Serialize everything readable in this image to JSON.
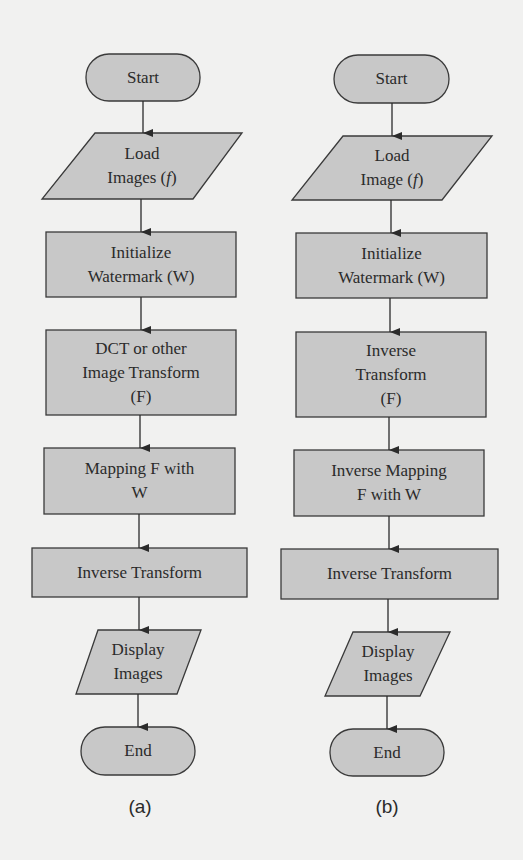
{
  "colors": {
    "background": "#f1f1f0",
    "shape_fill": "#c8c8c8",
    "shape_stroke": "#3a3a3a",
    "text": "#2b2b2b",
    "arrow": "#2b2b2b"
  },
  "flowcharts": [
    {
      "caption": "(a)",
      "nodes": [
        {
          "id": "a-start",
          "type": "terminal",
          "lines": [
            "Start"
          ]
        },
        {
          "id": "a-load",
          "type": "io",
          "lines": [
            "Load",
            "Images (f)"
          ]
        },
        {
          "id": "a-init",
          "type": "process",
          "lines": [
            "Initialize",
            "Watermark (W)"
          ]
        },
        {
          "id": "a-dct",
          "type": "process",
          "lines": [
            "DCT or other",
            "Image Transform",
            "(F)"
          ]
        },
        {
          "id": "a-map",
          "type": "process",
          "lines": [
            "Mapping F with",
            "W"
          ]
        },
        {
          "id": "a-inv",
          "type": "process",
          "lines": [
            "Inverse Transform"
          ]
        },
        {
          "id": "a-display",
          "type": "io",
          "lines": [
            "Display",
            "Images"
          ]
        },
        {
          "id": "a-end",
          "type": "terminal",
          "lines": [
            "End"
          ]
        }
      ]
    },
    {
      "caption": "(b)",
      "nodes": [
        {
          "id": "b-start",
          "type": "terminal",
          "lines": [
            "Start"
          ]
        },
        {
          "id": "b-load",
          "type": "io",
          "lines": [
            "Load",
            "Image (f)"
          ]
        },
        {
          "id": "b-init",
          "type": "process",
          "lines": [
            "Initialize",
            "Watermark (W)"
          ]
        },
        {
          "id": "b-invtf",
          "type": "process",
          "lines": [
            "Inverse",
            "Transform",
            "(F)"
          ]
        },
        {
          "id": "b-invmap",
          "type": "process",
          "lines": [
            "Inverse Mapping",
            "F with W"
          ]
        },
        {
          "id": "b-inv",
          "type": "process",
          "lines": [
            "Inverse Transform"
          ]
        },
        {
          "id": "b-display",
          "type": "io",
          "lines": [
            "Display",
            "Images"
          ]
        },
        {
          "id": "b-end",
          "type": "terminal",
          "lines": [
            "End"
          ]
        }
      ]
    }
  ]
}
